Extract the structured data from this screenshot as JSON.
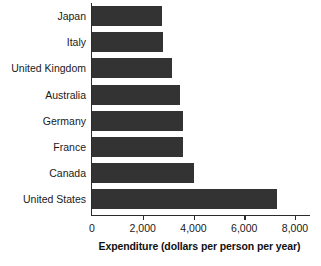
{
  "chart_data": {
    "type": "bar",
    "orientation": "horizontal",
    "title": "",
    "subtitle": "",
    "xlabel": "Expenditure (dollars per person per year)",
    "ylabel": "",
    "categories": [
      "Japan",
      "Italy",
      "United Kingdom",
      "Australia",
      "Germany",
      "France",
      "Canada",
      "United States"
    ],
    "values": [
      2750,
      2800,
      3150,
      3450,
      3600,
      3600,
      4000,
      7300
    ],
    "xlim": [
      0,
      8600
    ],
    "xticks": [
      0,
      2000,
      4000,
      6000,
      8000
    ],
    "xtick_labels": [
      "0",
      "2,000",
      "4,000",
      "6,000",
      "8,000"
    ],
    "grid": false,
    "legend": false,
    "bar_color": "#333333",
    "axis_color": "#2b2b2b",
    "background_color": "#ffffff"
  }
}
